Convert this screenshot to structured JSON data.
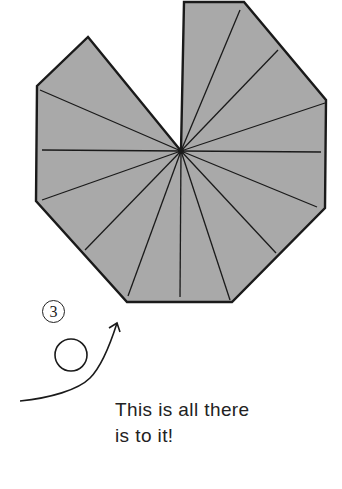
{
  "diagram": {
    "shape": {
      "fill": "#a9a9a9",
      "stroke": "#1a1a1a",
      "center": [
        181,
        151
      ],
      "outline": [
        [
          184,
          2
        ],
        [
          244,
          2
        ],
        [
          326,
          100
        ],
        [
          325,
          208
        ],
        [
          232,
          302
        ],
        [
          127,
          302
        ],
        [
          36,
          201
        ],
        [
          37,
          86
        ],
        [
          88,
          37
        ],
        [
          181,
          151
        ]
      ],
      "crease_ends": [
        [
          240,
          10
        ],
        [
          278,
          50
        ],
        [
          325,
          103
        ],
        [
          321,
          152
        ],
        [
          317,
          207
        ],
        [
          276,
          253
        ],
        [
          230,
          300
        ],
        [
          180,
          297
        ],
        [
          128,
          296
        ],
        [
          85,
          250
        ],
        [
          42,
          200
        ],
        [
          42,
          150
        ],
        [
          40,
          90
        ]
      ]
    },
    "step": {
      "number": "3",
      "loop_center": [
        71,
        355
      ],
      "loop_radius": 16,
      "arrow_tip": [
        117,
        323
      ]
    },
    "caption": {
      "line1": "This is all there",
      "line2": "is to it!"
    }
  }
}
